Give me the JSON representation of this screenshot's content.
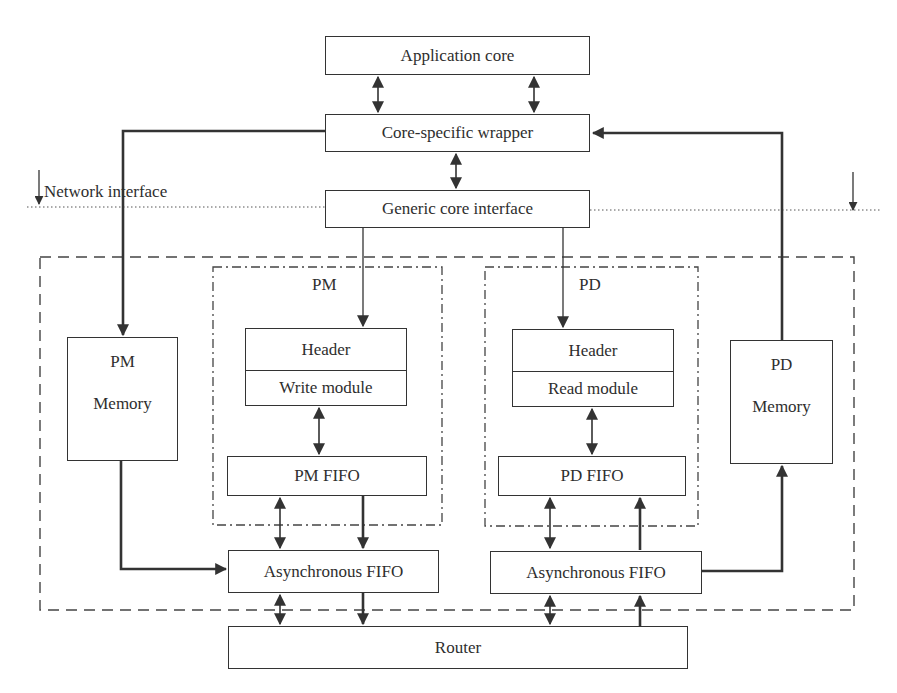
{
  "diagram": {
    "colors": {
      "line": "#333333",
      "text": "#2e2e2e",
      "background": "#ffffff"
    },
    "boundary_label": "Network interface",
    "blocks": {
      "application_core": "Application core",
      "core_specific_wrapper": "Core-specific wrapper",
      "generic_core_interface": "Generic core interface",
      "pm_group_label": "PM",
      "pd_group_label": "PD",
      "pm_header": "Header",
      "write_module": "Write module",
      "pd_header": "Header",
      "read_module": "Read module",
      "pm_memory_line1": "PM",
      "pm_memory_line2": "Memory",
      "pd_memory_line1": "PD",
      "pd_memory_line2": "Memory",
      "pm_fifo": "PM FIFO",
      "pd_fifo": "PD FIFO",
      "async_fifo_left": "Asynchronous FIFO",
      "async_fifo_right": "Asynchronous FIFO",
      "router": "Router"
    },
    "connections": [
      {
        "from": "Application core",
        "to": "Core-specific wrapper",
        "type": "bidirectional",
        "count": 2
      },
      {
        "from": "Core-specific wrapper",
        "to": "Generic core interface",
        "type": "bidirectional"
      },
      {
        "from": "Core-specific wrapper",
        "to": "PM Memory",
        "type": "directed"
      },
      {
        "from": "PD Memory",
        "to": "Core-specific wrapper",
        "type": "directed"
      },
      {
        "from": "Generic core interface",
        "to": "Header (Write module)",
        "type": "directed"
      },
      {
        "from": "Generic core interface",
        "to": "Header (Read module)",
        "type": "directed"
      },
      {
        "from": "Write module",
        "to": "PM FIFO",
        "type": "bidirectional"
      },
      {
        "from": "Read module",
        "to": "PD FIFO",
        "type": "bidirectional"
      },
      {
        "from": "PM FIFO",
        "to": "Asynchronous FIFO (left)",
        "type": "bidirectional"
      },
      {
        "from": "PM FIFO",
        "to": "Asynchronous FIFO (left)",
        "type": "directed"
      },
      {
        "from": "PM Memory",
        "to": "Asynchronous FIFO (left)",
        "type": "directed"
      },
      {
        "from": "PD FIFO",
        "to": "Asynchronous FIFO (right)",
        "type": "bidirectional"
      },
      {
        "from": "Asynchronous FIFO (right)",
        "to": "PD FIFO",
        "type": "directed"
      },
      {
        "from": "Asynchronous FIFO (right)",
        "to": "PD Memory",
        "type": "directed"
      },
      {
        "from": "Asynchronous FIFO (left)",
        "to": "Router",
        "type": "bidirectional"
      },
      {
        "from": "Asynchronous FIFO (left)",
        "to": "Router",
        "type": "directed"
      },
      {
        "from": "Asynchronous FIFO (right)",
        "to": "Router",
        "type": "bidirectional"
      },
      {
        "from": "Router",
        "to": "Asynchronous FIFO (right)",
        "type": "directed"
      }
    ]
  }
}
